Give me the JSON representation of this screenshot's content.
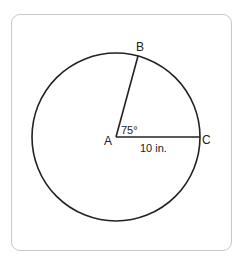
{
  "diagram": {
    "center_label": "A",
    "point_b_label": "B",
    "point_c_label": "C",
    "angle_label": "75°",
    "radius_label": "10 in.",
    "colors": {
      "stroke": "#222222",
      "frame": "#c8c8c8"
    }
  }
}
